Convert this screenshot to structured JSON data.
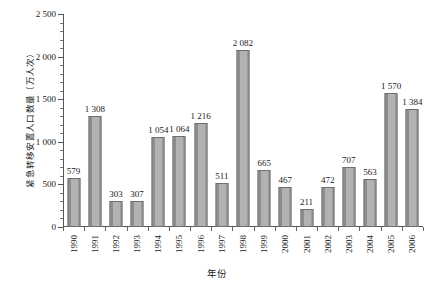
{
  "chart_data": {
    "type": "bar",
    "title": "",
    "xlabel": "年份",
    "ylabel": "紧急转移安置人口数量（万人次）",
    "ylim": [
      0,
      2500
    ],
    "ytick_step": 500,
    "yminor_step": 100,
    "grid": false,
    "legend": null,
    "categories": [
      "1990",
      "1991",
      "1992",
      "1993",
      "1994",
      "1995",
      "1996",
      "1997",
      "1998",
      "1999",
      "2000",
      "2001",
      "2002",
      "2003",
      "2004",
      "2005",
      "2006"
    ],
    "values": [
      579,
      1308,
      303,
      307,
      1054,
      1064,
      1216,
      511,
      2082,
      665,
      467,
      211,
      472,
      707,
      563,
      1570,
      1384
    ],
    "value_labels": [
      "579",
      "1 308",
      "303",
      "307",
      "1 054",
      "1 064",
      "1 216",
      "511",
      "2 082",
      "665",
      "467",
      "211",
      "472",
      "707",
      "563",
      "1 570",
      "1 384"
    ],
    "ytick_labels": [
      "0",
      "500",
      "1 000",
      "1 500",
      "2 000",
      "2 500"
    ],
    "ytick_values": [
      0,
      500,
      1000,
      1500,
      2000,
      2500
    ],
    "bar_fill_color": "#a8a8a8",
    "bar_edge_color": "#6e6e6e",
    "axis_color": "#555555",
    "text_color": "#1a1a1a",
    "background_color": "#ffffff"
  }
}
